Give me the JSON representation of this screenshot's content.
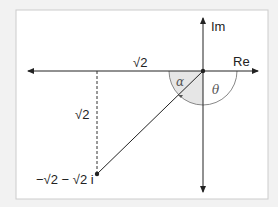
{
  "diagram": {
    "axes": {
      "real_label": "Re",
      "imag_label": "Im"
    },
    "point_label": "−√2 − √2 i",
    "horizontal_distance_label": "√2",
    "vertical_distance_label": "√2",
    "angle_alpha": "α",
    "angle_theta": "θ",
    "colors": {
      "line": "#222222",
      "shade": "#e4e4e4",
      "arc": "#888888",
      "background": "#ffffff",
      "border": "#cccccc"
    }
  }
}
